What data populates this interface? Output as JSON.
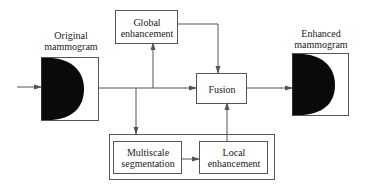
{
  "diagram": {
    "input": {
      "label_line1": "Original",
      "label_line2": "mammogram"
    },
    "output": {
      "label_line1": "Enhanced",
      "label_line2": "mammogram"
    },
    "global": {
      "line1": "Global",
      "line2": "enhancement"
    },
    "fusion": {
      "label": "Fusion"
    },
    "multiscale": {
      "line1": "Multiscale",
      "line2": "segmentation"
    },
    "local": {
      "line1": "Local",
      "line2": "enhancement"
    }
  },
  "colors": {
    "line": "#555555",
    "fill": "#0a0a0a"
  }
}
